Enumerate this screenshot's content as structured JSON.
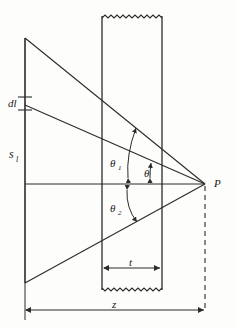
{
  "figure": {
    "background_color": "#fdfdfc",
    "line_color": "#2b2b2b",
    "label_color": "#1a1a1a"
  },
  "labels": {
    "dl": "dl",
    "s_l": "s",
    "s_l_sub": "l",
    "theta": "θ",
    "theta1": "θ",
    "theta1_sub": "1",
    "theta2": "θ",
    "theta2_sub": "2",
    "t": "t",
    "z": "z",
    "P": "P"
  },
  "elements": {
    "source_line": {
      "name": "vertical-source-line",
      "x": 25,
      "y_top": 38,
      "y_bottom": 283
    },
    "slab": {
      "name": "slab-rectangle",
      "x_left": 102,
      "x_right": 162,
      "y_top": 16,
      "y_bottom": 290,
      "break_top": true,
      "break_bottom": true
    },
    "point_P": {
      "x": 205,
      "y": 184
    },
    "axis": {
      "x_start": 25,
      "x_end": 205,
      "y": 184
    },
    "ray_top": {
      "from_x": 25,
      "from_y": 38,
      "to_x": 205,
      "to_y": 184
    },
    "ray_dl": {
      "from_x": 25,
      "from_y": 105,
      "to_x": 205,
      "to_y": 184
    },
    "ray_bottom": {
      "from_x": 25,
      "from_y": 283,
      "to_x": 205,
      "to_y": 184
    },
    "dashed_drop": {
      "x": 205,
      "y_top": 184,
      "y_bottom": 310
    },
    "dim_t": {
      "x_left": 102,
      "x_right": 162,
      "y": 268
    },
    "dim_z": {
      "x_left": 25,
      "x_right": 205,
      "y": 310
    },
    "dl_ticks": {
      "x": 25,
      "y_upper": 97,
      "y_lower": 110,
      "tick_half_width": 7
    }
  },
  "annotations": {
    "theta_desc": "angle between dl ray and axis at P",
    "theta1_desc": "angle from axis to upper ray",
    "theta2_desc": "angle from axis down to lower ray"
  }
}
